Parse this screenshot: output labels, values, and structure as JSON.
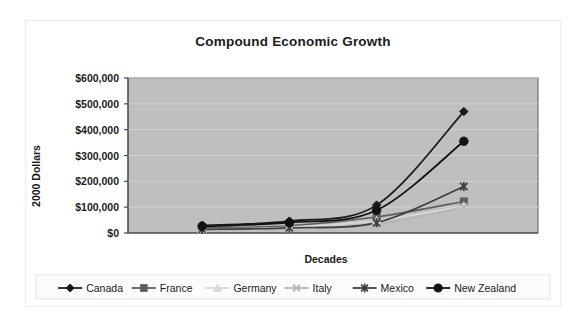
{
  "chart_data": {
    "type": "line",
    "title": "Compound Economic Growth",
    "xlabel": "Decades",
    "ylabel": "2000 Dollars",
    "x": [
      1,
      2,
      3,
      4
    ],
    "categories": [
      "",
      "",
      "",
      ""
    ],
    "xticklabels": [
      "",
      "",
      "",
      ""
    ],
    "yticklabels": [
      "$0",
      "$100,000",
      "$200,000",
      "$300,000",
      "$400,000",
      "$500,000",
      "$600,000"
    ],
    "ytickvalues": [
      0,
      100000,
      200000,
      300000,
      400000,
      500000,
      600000
    ],
    "ylim": [
      0,
      600000
    ],
    "grid": "horizontal",
    "legend_position": "bottom",
    "plot_background": "#bfbfbf",
    "series": [
      {
        "name": "Canada",
        "color": "#1a1a1a",
        "marker": "diamond",
        "values": [
          30000,
          46000,
          108000,
          470000
        ]
      },
      {
        "name": "France",
        "color": "#5e5e5e",
        "marker": "square",
        "values": [
          20000,
          28000,
          62000,
          122000
        ]
      },
      {
        "name": "Germany",
        "color": "#d8d8d8",
        "marker": "triangle",
        "values": [
          15000,
          22000,
          48000,
          104000
        ]
      },
      {
        "name": "Italy",
        "color": "#b4b4b4",
        "marker": "cross",
        "values": [
          12000,
          18000,
          34000,
          100000
        ]
      },
      {
        "name": "Mexico",
        "color": "#3d3d3d",
        "marker": "star",
        "values": [
          14000,
          20000,
          40000,
          180000
        ]
      },
      {
        "name": "New Zealand",
        "color": "#111111",
        "marker": "circle",
        "values": [
          26000,
          40000,
          88000,
          355000
        ]
      }
    ]
  }
}
